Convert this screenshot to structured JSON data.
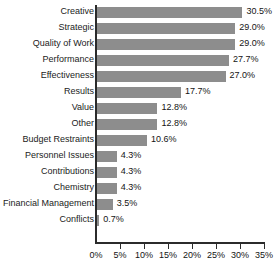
{
  "chart_data": {
    "type": "bar",
    "orientation": "horizontal",
    "title": "",
    "subtitle": "",
    "xlabel": "",
    "ylabel": "",
    "xlim": [
      0,
      35
    ],
    "grid": false,
    "legend": false,
    "bar_color": "#8d8d8d",
    "axis_color": "#2b2b2b",
    "text_color": "#141414",
    "value_suffix": "%",
    "xticks": [
      0,
      5,
      10,
      15,
      20,
      25,
      30,
      35
    ],
    "xtick_labels": [
      "0%",
      "5%",
      "10%",
      "15%",
      "20%",
      "25%",
      "30%",
      "35%"
    ],
    "categories": [
      "Creative",
      "Strategic",
      "Quality of Work",
      "Performance",
      "Effectiveness",
      "Results",
      "Value",
      "Other",
      "Budget Restraints",
      "Personnel Issues",
      "Contributions",
      "Chemistry",
      "Financial Management",
      "Conflicts"
    ],
    "values": [
      30.5,
      29.0,
      29.0,
      27.7,
      27.0,
      17.7,
      12.8,
      12.8,
      10.6,
      4.3,
      4.3,
      4.3,
      3.5,
      0.7
    ],
    "value_labels": [
      "30.5%",
      "29.0%",
      "29.0%",
      "27.7%",
      "27.0%",
      "17.7%",
      "12.8%",
      "12.8%",
      "10.6%",
      "4.3%",
      "4.3%",
      "4.3%",
      "3.5%",
      "0.7%"
    ]
  }
}
